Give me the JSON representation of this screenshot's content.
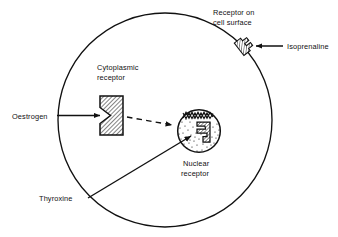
{
  "figure": {
    "type": "biological-cell-diagram",
    "background_color": "#ffffff",
    "line_color": "#111111"
  },
  "cell": {
    "name": "cell",
    "shape": "circle",
    "cx": 165,
    "cy": 120,
    "r": 107
  },
  "nucleus": {
    "name": "nucleus",
    "shape": "circle",
    "cx": 199,
    "cy": 131,
    "r": 22,
    "fill": "stippled"
  },
  "labels": {
    "surface_receptor": {
      "line1": "Receptor on",
      "line2": "cell surface"
    },
    "isoprenaline": "Isoprenaline",
    "cytoplasmic_receptor": {
      "line1": "Cytoplasmic",
      "line2": "receptor"
    },
    "oestrogen": "Oestrogen",
    "nuclear_receptor": {
      "line1": "Nuclear",
      "line2": "receptor"
    },
    "thyroxine": "Thyroxine"
  },
  "receptors": [
    {
      "id": "surface-receptor",
      "label": "Receptor on cell surface",
      "ligand": "Isoprenaline",
      "location": "cell membrane",
      "fill": "hatched"
    },
    {
      "id": "cytoplasmic-receptor",
      "label": "Cytoplasmic receptor",
      "ligand": "Oestrogen",
      "location": "cytoplasm",
      "fill": "hatched"
    },
    {
      "id": "nuclear-receptor",
      "label": "Nuclear receptor",
      "ligand": "Thyroxine",
      "location": "nucleus",
      "fill": "hatched"
    }
  ],
  "arrows": [
    {
      "id": "isoprenaline-arrow",
      "from": "Isoprenaline",
      "to": "surface receptor",
      "style": "solid"
    },
    {
      "id": "oestrogen-arrow",
      "from": "Oestrogen",
      "to": "cytoplasmic receptor",
      "style": "solid"
    },
    {
      "id": "translocation-arrow",
      "from": "cytoplasmic receptor",
      "to": "nucleus",
      "style": "dashed"
    },
    {
      "id": "thyroxine-arrow",
      "from": "Thyroxine",
      "to": "nuclear receptor",
      "style": "solid"
    }
  ]
}
